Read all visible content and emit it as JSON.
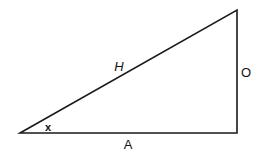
{
  "diagram": {
    "type": "right-triangle",
    "stroke_color": "#1a1a1a",
    "vertices": {
      "angle_x": [
        20,
        133
      ],
      "right_angle": [
        237,
        133
      ],
      "top": [
        237,
        10
      ]
    },
    "labels": {
      "hypotenuse": "H",
      "opposite": "O",
      "adjacent": "A",
      "angle": "x"
    }
  }
}
